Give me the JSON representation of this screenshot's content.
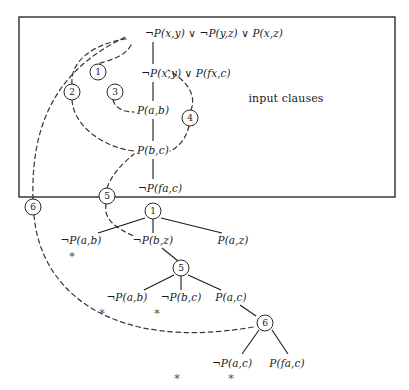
{
  "figure": {
    "name": "linear-resolution-proof-diagram",
    "region_label": "input clauses",
    "colors": {
      "ink": "#1a1a1a",
      "box": "#2b2b2b",
      "dashed": "#3a3a3a",
      "star": "#4a4a4a"
    }
  },
  "input_clauses": [
    {
      "id": "c1",
      "text": "¬P(x,y) ∨ ¬P(y,z) ∨ P(x,z)",
      "x": 214,
      "y": 33
    },
    {
      "id": "c2",
      "text": "¬P(x,y) ∨ P(fx,c)",
      "x": 186,
      "y": 73
    },
    {
      "id": "c3",
      "text": "P(a,b)",
      "x": 153,
      "y": 110
    },
    {
      "id": "c4",
      "text": "P(b,c)",
      "x": 153,
      "y": 150
    },
    {
      "id": "c5",
      "text": "¬P(fa,c)",
      "x": 160,
      "y": 188
    }
  ],
  "proof_tree": {
    "level1": [
      {
        "id": "n1",
        "text": "¬P(a,b)",
        "x": 81,
        "y": 240
      },
      {
        "id": "n2",
        "text": "¬P(b,z)",
        "x": 153,
        "y": 240
      },
      {
        "id": "n3",
        "text": "P(a,z)",
        "x": 233,
        "y": 240
      }
    ],
    "level2": [
      {
        "id": "n4",
        "text": "¬P(a,b)",
        "x": 127,
        "y": 297
      },
      {
        "id": "n5",
        "text": "¬P(b,c)",
        "x": 181,
        "y": 297
      },
      {
        "id": "n6",
        "text": "P(a,c)",
        "x": 231,
        "y": 297
      }
    ],
    "level3": [
      {
        "id": "n7",
        "text": "¬P(a,c)",
        "x": 232,
        "y": 363
      },
      {
        "id": "n8",
        "text": "P(fa,c)",
        "x": 287,
        "y": 363
      }
    ]
  },
  "closed_branch_marks": [
    {
      "id": "s1",
      "symbol": "*",
      "x": 72,
      "y": 256
    },
    {
      "id": "s2",
      "symbol": "*",
      "x": 102,
      "y": 313
    },
    {
      "id": "s3",
      "symbol": "*",
      "x": 157,
      "y": 313
    },
    {
      "id": "s4",
      "symbol": "*",
      "x": 177,
      "y": 378
    },
    {
      "id": "s5",
      "symbol": "*",
      "x": 231,
      "y": 378
    }
  ],
  "step_markers": [
    {
      "id": "m1",
      "label": "1",
      "x": 98,
      "y": 72
    },
    {
      "id": "m2",
      "label": "2",
      "x": 72,
      "y": 92
    },
    {
      "id": "m3",
      "label": "3",
      "x": 115,
      "y": 92
    },
    {
      "id": "m4",
      "label": "4",
      "x": 190,
      "y": 118
    },
    {
      "id": "m5",
      "label": "5",
      "x": 107,
      "y": 196
    },
    {
      "id": "m6",
      "label": "6",
      "x": 33,
      "y": 207
    },
    {
      "id": "m7",
      "label": "1",
      "x": 153,
      "y": 211
    },
    {
      "id": "m8",
      "label": "5",
      "x": 181,
      "y": 268
    },
    {
      "id": "m9",
      "label": "6",
      "x": 265,
      "y": 323
    }
  ],
  "box": {
    "x": 19,
    "y": 17,
    "width": 376,
    "height": 180,
    "label_x": 286,
    "label_y": 98
  }
}
